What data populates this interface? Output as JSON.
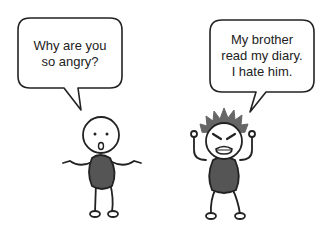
{
  "panel": {
    "left_character": {
      "speech": [
        "Why are you",
        "so angry?"
      ],
      "emotion": "confused"
    },
    "right_character": {
      "speech": [
        "My brother",
        "read my diary.",
        "I hate him."
      ],
      "emotion": "angry"
    },
    "colors": {
      "outline": "#222222",
      "body": "#555555",
      "hair": "#666666",
      "background": "#ffffff"
    }
  }
}
